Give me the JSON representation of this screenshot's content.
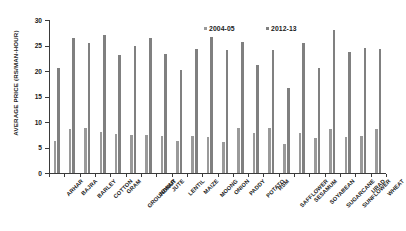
{
  "chart_data": {
    "type": "bar",
    "title": "",
    "subtitle": "",
    "xlabel": "",
    "ylabel": "AVERAGE PRICE (RS/MAN-HOUR)",
    "ylim": [
      0,
      30
    ],
    "yticks": [
      0,
      5,
      10,
      15,
      20,
      25,
      30
    ],
    "ytick_labels": [
      "0",
      "5",
      "10",
      "15",
      "20",
      "25",
      "30"
    ],
    "grid": false,
    "legend_position": "top-center",
    "categories": [
      "ARHAR",
      "BAJRA",
      "BARLEY",
      "COTTON",
      "GRAM",
      "GROUNDNUT",
      "JOWAR",
      "JUTE",
      "LENTIL",
      "MAIZE",
      "MOONG",
      "ONION",
      "PADDY",
      "POTATO",
      "RSM",
      "SAFFLOWER",
      "SESAMUM",
      "SOYABEAN",
      "SUGARCANE",
      "SUNFLOWER",
      "URAD",
      "WHEAT"
    ],
    "series": [
      {
        "name": "2004-05",
        "color": "#9a9a9a",
        "values": [
          6.2,
          8.7,
          8.9,
          8.0,
          7.7,
          7.4,
          7.4,
          7.2,
          6.3,
          7.3,
          7.1,
          6.1,
          8.9,
          7.8,
          8.8,
          5.6,
          7.8,
          6.8,
          8.7,
          7.0,
          7.2,
          8.6
        ]
      },
      {
        "name": "2012-13",
        "color": "#808080",
        "values": [
          20.5,
          26.4,
          25.5,
          27.1,
          23.2,
          25.0,
          26.4,
          23.4,
          20.2,
          24.3,
          26.6,
          24.2,
          25.6,
          21.2,
          24.1,
          16.7,
          25.5,
          20.5,
          28.1,
          23.7,
          24.5,
          24.4
        ]
      }
    ]
  },
  "colors": {
    "axis": "#3a3a3a",
    "text": "#1a1a1a",
    "background": "#ffffff"
  }
}
